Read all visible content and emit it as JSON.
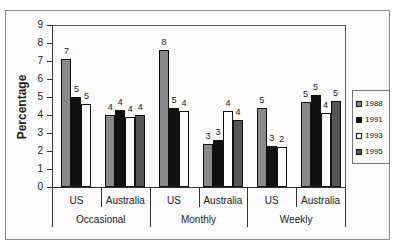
{
  "chart_data": {
    "type": "bar",
    "title": "",
    "xlabel": "",
    "ylabel": "Percentage",
    "ylim": [
      0,
      9
    ],
    "yticks": [
      0,
      1,
      2,
      3,
      4,
      5,
      6,
      7,
      8,
      9
    ],
    "grid": false,
    "legend_position": "right",
    "groups": [
      "Occasional",
      "Monthly",
      "Weekly"
    ],
    "categories": [
      "Occasional US",
      "Occasional Australia",
      "Monthly US",
      "Monthly Australia",
      "Weekly US",
      "Weekly Australia"
    ],
    "category_labels": [
      "US",
      "Australia",
      "US",
      "Australia",
      "US",
      "Australia"
    ],
    "series": [
      {
        "name": "1988",
        "color": "#8a8a8a",
        "values": [
          7.1,
          4.0,
          7.6,
          2.4,
          4.4,
          4.7
        ],
        "labels": [
          "7",
          "4",
          "8",
          "3",
          "5",
          "5"
        ]
      },
      {
        "name": "1991",
        "color": "#111111",
        "values": [
          5.0,
          4.3,
          4.4,
          2.6,
          2.3,
          5.1
        ],
        "labels": [
          "5",
          "4",
          "5",
          "3",
          "3",
          "5"
        ]
      },
      {
        "name": "1993",
        "color": "#ffffff",
        "values": [
          4.6,
          3.9,
          4.2,
          4.2,
          2.2,
          4.1
        ],
        "labels": [
          "5",
          "4",
          "4",
          "4",
          "2",
          "4"
        ]
      },
      {
        "name": "1995",
        "color": "#555555",
        "values": [
          null,
          4.0,
          null,
          3.7,
          null,
          4.8
        ],
        "labels": [
          "",
          "4",
          "",
          "4",
          "",
          "5"
        ]
      }
    ]
  }
}
